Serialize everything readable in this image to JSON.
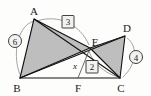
{
  "figure": {
    "type": "geometry-diagram",
    "colors": {
      "background": "#fdfdfc",
      "shade": "#b3b3b3",
      "stroke": "#111111",
      "arc": "#8d8d8d",
      "badge_fill": "#f2f2f0"
    },
    "vertices": [
      {
        "name": "A",
        "label": "A",
        "x": 34,
        "y": 19
      },
      {
        "name": "B",
        "label": "B",
        "x": 20,
        "y": 78
      },
      {
        "name": "C",
        "label": "C",
        "x": 120,
        "y": 78
      },
      {
        "name": "D",
        "label": "D",
        "x": 125,
        "y": 36
      },
      {
        "name": "E",
        "label": "E",
        "x": 90,
        "y": 48
      },
      {
        "name": "F",
        "label": "F",
        "x": 78,
        "y": 78
      }
    ],
    "measures": [
      {
        "name": "measure-ab",
        "label": "6",
        "shape": "circle",
        "x": 15,
        "y": 41
      },
      {
        "name": "measure-ae",
        "label": "3",
        "shape": "box",
        "x": 68,
        "y": 22
      },
      {
        "name": "measure-dc",
        "label": "4",
        "shape": "circle",
        "x": 136,
        "y": 57
      },
      {
        "name": "measure-ec",
        "label": "2",
        "shape": "box",
        "x": 92,
        "y": 67
      }
    ],
    "angles": [
      {
        "name": "angle-x",
        "label": "x",
        "x": 75,
        "y": 66
      }
    ]
  }
}
